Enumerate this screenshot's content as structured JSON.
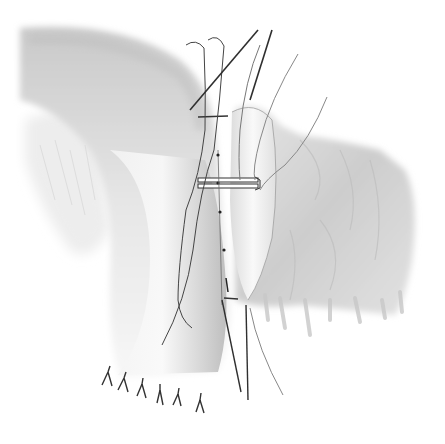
{
  "figure": {
    "type": "surgical-illustration",
    "description": "Grayscale illustration of an intestinal anastomosis: a curved bowel limb descending from upper left, joined to a wide mesenteric/omental tissue mass on the right, with stay sutures, a clamp bar, and interrupted sutures along the cut edge.",
    "colors": {
      "background": "#ffffff",
      "tissue_dark": "#b8b8b8",
      "tissue_mid": "#d4d4d4",
      "tissue_light": "#ececec",
      "suture": "#3a3a3a",
      "suture_light": "#7a7a7a"
    },
    "elements": {
      "bowel_limb": "curved-tubular-bowel",
      "tissue_mass": "omental-tissue-mass",
      "clamp": "anastomosis-clamp-bar",
      "stay_sutures_top": 2,
      "needle_lines": 4,
      "interrupted_sutures_bottom": 6,
      "midline_suture_knots": 4
    }
  }
}
